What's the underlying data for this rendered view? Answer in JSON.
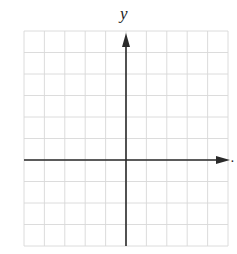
{
  "diagram": {
    "type": "coordinate-plane",
    "axis_labels": {
      "y": "y",
      "x": "."
    },
    "grid": {
      "columns": 10,
      "rows": 10,
      "y_axis_column": 5,
      "x_axis_row": 6,
      "left": 24,
      "top": 31,
      "right": 228,
      "bottom": 246
    },
    "colors": {
      "grid": "#d8d8d8",
      "axis": "#2a2a2a",
      "background": "#ffffff"
    }
  }
}
